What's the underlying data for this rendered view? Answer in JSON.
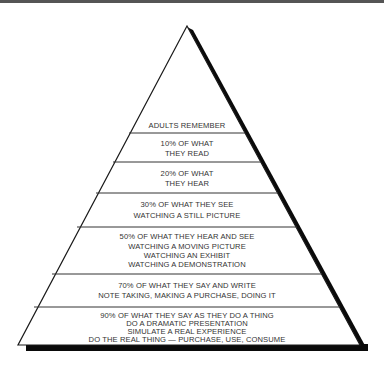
{
  "title": "Adults Remember",
  "colors": {
    "outline": "#1a1a1a",
    "shadow": "#0a0a0a",
    "text": "#333333",
    "background": "#ffffff"
  },
  "pyramid": {
    "header": "ADULTS REMEMBER",
    "levels": [
      {
        "lines": [
          "10% OF WHAT",
          "THEY READ"
        ]
      },
      {
        "lines": [
          "20% OF WHAT",
          "THEY HEAR"
        ]
      },
      {
        "lines": [
          "30% OF WHAT THEY SEE",
          "WATCHING A STILL PICTURE"
        ]
      },
      {
        "lines": [
          "50% OF WHAT THEY HEAR AND SEE",
          "WATCHING A MOVING PICTURE",
          "WATCHING AN EXHIBIT",
          "WATCHING A DEMONSTRATION"
        ]
      },
      {
        "lines": [
          "70% OF WHAT THEY SAY AND WRITE",
          "NOTE TAKING, MAKING A PURCHASE, DOING IT"
        ]
      },
      {
        "lines": [
          "90% OF WHAT THEY SAY AS THEY DO A THING",
          "DO A DRAMATIC PRESENTATION",
          "SIMULATE A REAL EXPERIENCE",
          "DO THE REAL THING — PURCHASE, USE, CONSUME"
        ]
      }
    ]
  }
}
